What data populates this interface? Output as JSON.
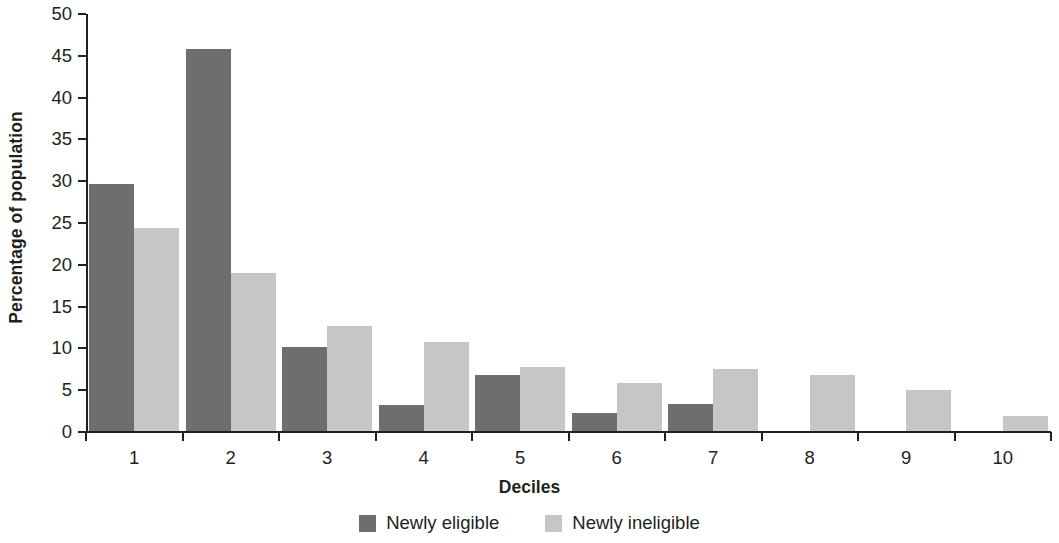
{
  "chart_data": {
    "type": "bar",
    "title": "",
    "xlabel": "Deciles",
    "ylabel": "Percentage of population",
    "categories": [
      "1",
      "2",
      "3",
      "4",
      "5",
      "6",
      "7",
      "8",
      "9",
      "10"
    ],
    "series": [
      {
        "name": "Newly eligible",
        "color": "#6e6e6e",
        "values": [
          29.5,
          45.7,
          10.0,
          3.1,
          6.7,
          2.1,
          3.2,
          0,
          0,
          0
        ]
      },
      {
        "name": "Newly ineligible",
        "color": "#c6c6c6",
        "values": [
          24.3,
          18.9,
          12.6,
          10.6,
          7.6,
          5.8,
          7.4,
          6.7,
          4.9,
          1.8
        ]
      }
    ],
    "ylim": [
      0,
      50
    ],
    "ytick_labels": [
      "0",
      "5",
      "10",
      "15",
      "20",
      "25",
      "30",
      "35",
      "40",
      "45",
      "50"
    ],
    "ytick_values": [
      0,
      5,
      10,
      15,
      20,
      25,
      30,
      35,
      40,
      45,
      50
    ],
    "grid": false,
    "legend_position": "bottom-center",
    "annotations": []
  },
  "legend": {
    "items": [
      {
        "label": "Newly eligible",
        "swatch": "dark-gray-swatch"
      },
      {
        "label": "Newly ineligible",
        "swatch": "light-gray-swatch"
      }
    ]
  }
}
